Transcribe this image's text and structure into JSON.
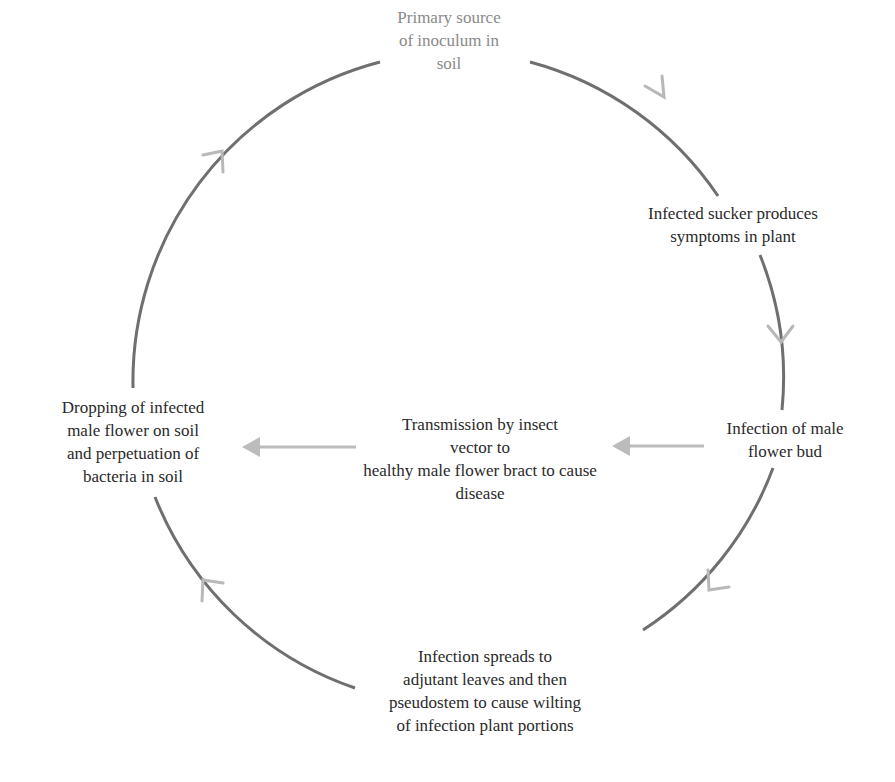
{
  "diagram": {
    "type": "disease-cycle",
    "colors": {
      "arc": "#6f6f6f",
      "arrowhead": "#b8b8b8",
      "horizontal_arrow": "#bcbcbc",
      "text": "#2a2a2a",
      "text_top": "#8a8a8a"
    },
    "nodes": {
      "top": {
        "lines": [
          "Primary source",
          "of inoculum in",
          "soil"
        ]
      },
      "upper_right": {
        "lines": [
          "Infected sucker produces",
          "symptoms in plant"
        ]
      },
      "right": {
        "lines": [
          "Infection of male",
          "flower bud"
        ]
      },
      "bottom": {
        "lines": [
          "Infection spreads to",
          "adjutant leaves and then",
          "pseudostem to cause wilting",
          "of infection plant portions"
        ]
      },
      "left": {
        "lines": [
          "Dropping of infected",
          "male flower on soil",
          "and perpetuation of",
          "bacteria in soil"
        ]
      },
      "center": {
        "lines": [
          "Transmission by insect",
          "vector to",
          "healthy male flower bract to cause",
          "disease"
        ]
      }
    },
    "edges": [
      {
        "from": "top",
        "to": "upper_right",
        "direction": "clockwise"
      },
      {
        "from": "upper_right",
        "to": "right",
        "direction": "clockwise"
      },
      {
        "from": "right",
        "to": "bottom",
        "direction": "clockwise"
      },
      {
        "from": "bottom",
        "to": "left",
        "direction": "clockwise"
      },
      {
        "from": "left",
        "to": "top",
        "direction": "clockwise"
      },
      {
        "from": "right",
        "to": "center",
        "direction": "leftward"
      },
      {
        "from": "center",
        "to": "left",
        "direction": "leftward"
      }
    ]
  }
}
